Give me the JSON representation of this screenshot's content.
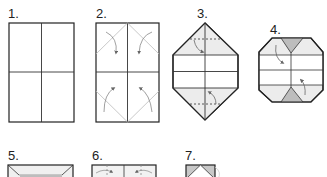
{
  "diagram": {
    "type": "origami-instructions",
    "steps": [
      {
        "label": "1.",
        "shape": "rectangle-creased-quarters"
      },
      {
        "label": "2.",
        "shape": "rectangle-fold-corners-to-center",
        "arrows": 4
      },
      {
        "label": "3.",
        "shape": "hexagon-fold-tips-in",
        "arrows": 2
      },
      {
        "label": "4.",
        "shape": "octagon-fold-flaps",
        "arrows": 2
      },
      {
        "label": "5.",
        "shape": "rectangle-with-inner-trapezoid"
      },
      {
        "label": "6.",
        "shape": "rectangle-fold-sides-in",
        "arrows": 2
      },
      {
        "label": "7.",
        "shape": "square-with-triangle-top"
      }
    ],
    "colors": {
      "line": "#222222",
      "crease": "#bbbbbb",
      "shade_light": "#e8e8e8",
      "shade_dark": "#b8b8b8",
      "arrow": "#666666"
    }
  }
}
